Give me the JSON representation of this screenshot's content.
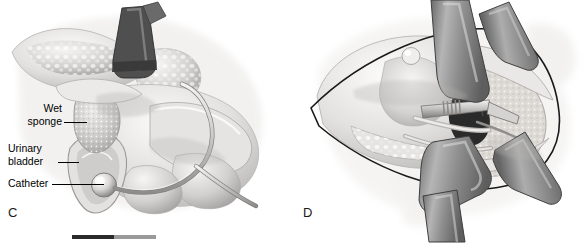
{
  "figure": {
    "type": "medical-surgical-illustration",
    "rendering": "grayscale airbrush anatomical artwork",
    "background_color": "#ffffff",
    "ink_color": "#000000",
    "width": 587,
    "height": 243
  },
  "panels": [
    {
      "id": "C",
      "letter": "C",
      "title": "Sagittal view: wet sponge packing with urinary bladder and catheter",
      "labels": [
        {
          "name": "wet-sponge",
          "lines": [
            "Wet",
            "sponge"
          ],
          "line1": "Wet",
          "line2": "sponge",
          "align": "right"
        },
        {
          "name": "urinary-bladder",
          "lines": [
            "Urinary",
            "bladder"
          ],
          "line1": "Urinary",
          "line2": "bladder",
          "align": "left"
        },
        {
          "name": "catheter",
          "lines": [
            "Catheter"
          ],
          "line1": "Catheter",
          "line2": "",
          "align": "left"
        }
      ]
    },
    {
      "id": "D",
      "letter": "D",
      "title": "Opened operative field held by retractor bands",
      "labels": []
    }
  ],
  "scale_bar": {
    "name": "scale-bar",
    "segments": [
      {
        "name": "dark-segment",
        "color": "#2b2b2b"
      },
      {
        "name": "light-segment",
        "color": "#9a9a9a"
      }
    ],
    "caption": ""
  },
  "palette": {
    "tissue_light": "#f2f1ef",
    "tissue_mid": "#d6d4d2",
    "tissue_shadow": "#a9a7a5",
    "tissue_deep": "#7d7b79",
    "retractor_gray": "#9d9d9d",
    "retractor_dark": "#6e6e6e",
    "outline": "#1a1a1a",
    "sponge_fill": "#cfcdcb",
    "catheter": "#bdbbb9"
  }
}
